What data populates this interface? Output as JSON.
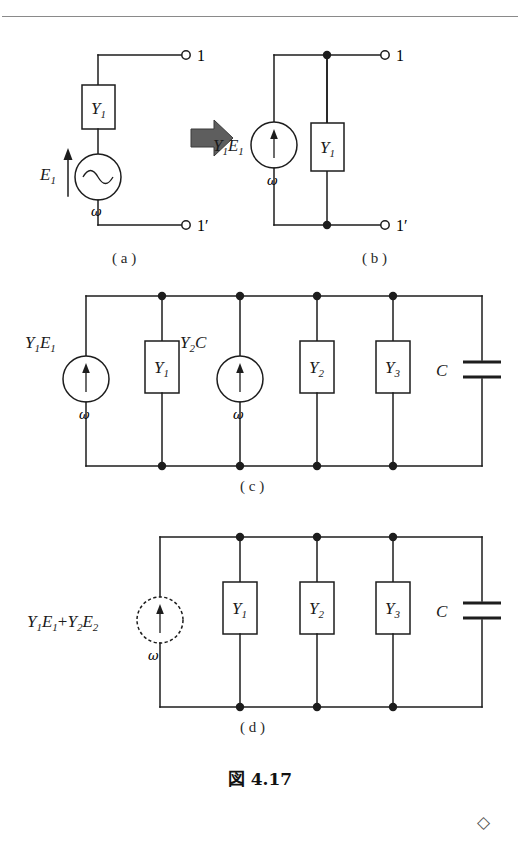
{
  "figure": {
    "caption": "図 4.17",
    "caption_number": "4.17",
    "end_mark": "◇",
    "transform_arrow": "right-block-arrow",
    "has_top_rule": true
  },
  "subfigures": [
    {
      "id": "a",
      "label": "( a )",
      "description": "voltage source E1 in series with admittance Y1 feeding terminals 1 and 1'",
      "source_type": "ac-voltage-sine",
      "elements": [
        "Y1",
        "E1",
        "omega"
      ],
      "terminals": [
        "1",
        "1'"
      ]
    },
    {
      "id": "b",
      "label": "( b )",
      "description": "Norton equivalent: current source Y1E1 in parallel with Y1",
      "source_type": "current-arrow",
      "elements": [
        "Y1E1",
        "Y1",
        "omega"
      ],
      "terminals": [
        "1",
        "1'"
      ]
    },
    {
      "id": "c",
      "label": "( c )",
      "description": "two current sources Y1E1 and Y2E2 in parallel with Y1, Y2, Y3 and C",
      "source_type": "current-arrow",
      "elements": [
        "Y1E1",
        "Y1",
        "Y2E2",
        "Y2",
        "Y3",
        "C",
        "omega"
      ],
      "terminals": []
    },
    {
      "id": "d",
      "label": "( d )",
      "description": "combined current source Y1E1+Y2E2 in parallel with Y1, Y2, Y3 and C",
      "source_type": "current-arrow-dashed",
      "elements": [
        "Y1E1+Y2E2",
        "Y1",
        "Y2",
        "Y3",
        "C",
        "omega"
      ],
      "terminals": []
    }
  ],
  "labels": {
    "Y1": {
      "base": "Y",
      "sub": "1"
    },
    "Y2": {
      "base": "Y",
      "sub": "2"
    },
    "Y3": {
      "base": "Y",
      "sub": "3"
    },
    "E1": {
      "base": "E",
      "sub": "1"
    },
    "C": {
      "base": "C",
      "sub": ""
    },
    "omega": "ω",
    "terminal_1": "1",
    "terminal_1p": "1′",
    "source_b": "Y₁E₁",
    "source_c1": "Y₁E₁",
    "source_c2": "Y₂E₂",
    "source_d": "Y₁E₁+Y₂E₂"
  },
  "colors": {
    "ink": "#1d1d1d",
    "rule": "#8a8a8a",
    "arrow_fill": "#5e5e5e",
    "arrow_stroke": "#3b3b3b",
    "paper": "#ffffff"
  }
}
